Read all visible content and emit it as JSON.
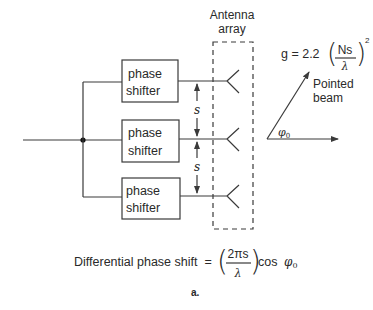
{
  "figure": {
    "panel_label": "a.",
    "antenna_label": {
      "line1": "Antenna",
      "line2": "array"
    },
    "phase_shifters": [
      {
        "line1": "phase",
        "line2": "shifter"
      },
      {
        "line1": "phase",
        "line2": "shifter"
      },
      {
        "line1": "phase",
        "line2": "shifter"
      }
    ],
    "spacing_labels": [
      "s",
      "s"
    ],
    "beam": {
      "label_line1": "Pointed",
      "label_line2": "beam",
      "angle_symbol": "φ",
      "angle_subscript": "0"
    },
    "gain_formula": {
      "lhs": "g = 2.2",
      "numerator": "Ns",
      "denominator": "λ",
      "exponent": "2"
    },
    "phase_formula": {
      "lhs": "Differential phase shift  =",
      "numerator": "2πs",
      "denominator": "λ",
      "trailing": "cos",
      "symbol": "φ",
      "subscript": "0"
    },
    "colors": {
      "line": "#3a3a3a",
      "text": "#2a2a2a",
      "background": "#ffffff"
    }
  }
}
